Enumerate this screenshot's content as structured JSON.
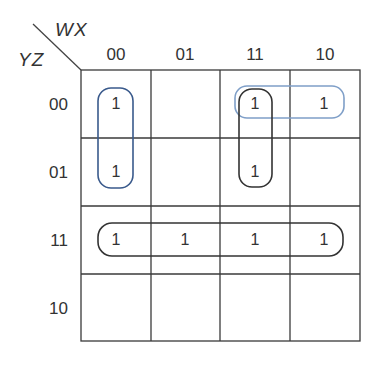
{
  "kmap": {
    "col_variables": "WX",
    "row_variables": "YZ",
    "col_headers": [
      "00",
      "01",
      "11",
      "10"
    ],
    "row_headers": [
      "00",
      "01",
      "11",
      "10"
    ],
    "cells": [
      [
        "1",
        "",
        "1",
        "1"
      ],
      [
        "1",
        "",
        "1",
        ""
      ],
      [
        "1",
        "1",
        "1",
        "1"
      ],
      [
        "",
        "",
        "",
        ""
      ]
    ],
    "groups": [
      {
        "name": "group-col00-rows00-01",
        "color": "#3a5a8c",
        "cells": [
          [
            0,
            0
          ],
          [
            1,
            0
          ]
        ]
      },
      {
        "name": "group-row00-cols11-10",
        "color": "#7f9fc8",
        "cells": [
          [
            0,
            2
          ],
          [
            0,
            3
          ]
        ]
      },
      {
        "name": "group-col11-rows00-01",
        "color": "#333333",
        "cells": [
          [
            0,
            2
          ],
          [
            1,
            2
          ]
        ]
      },
      {
        "name": "group-row11-all",
        "color": "#333333",
        "cells": [
          [
            2,
            0
          ],
          [
            2,
            1
          ],
          [
            2,
            2
          ],
          [
            2,
            3
          ]
        ]
      }
    ]
  }
}
